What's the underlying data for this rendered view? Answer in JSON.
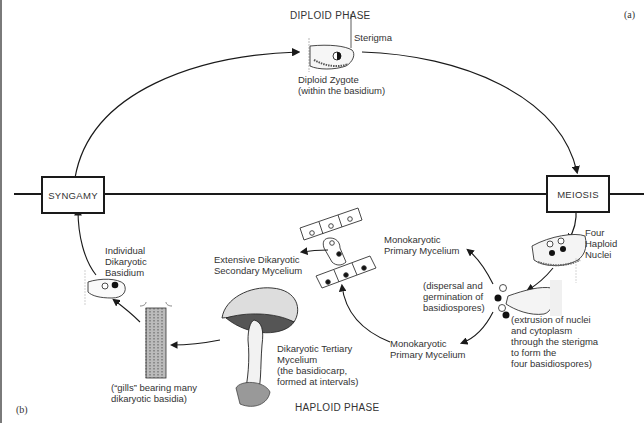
{
  "panels": {
    "top_right": "(a)",
    "bottom_left": "(b)"
  },
  "phases": {
    "diploid": "DIPLOID PHASE",
    "haploid": "HAPLOID PHASE"
  },
  "boxes": {
    "syngamy": "SYNGAMY",
    "meiosis": "MEIOSIS"
  },
  "labels": {
    "sterigma": "Sterigma",
    "diploid_zygote": "Diploid Zygote\n(within the basidium)",
    "four_haploid_nuclei": "Four\nHaploid\nNuclei",
    "extrusion": "(extrusion of nuclei\nand cytoplasm\nthrough the sterigma\nto form the\nfour basidiospores)",
    "dispersal": "(dispersal and\ngermination of\nbasidiospores)",
    "mono_primary_top": "Monokaryotic\nPrimary Mycelium",
    "mono_primary_bottom": "Monokaryotic\nPrimary Mycelium",
    "secondary_mycelium": "Extensive Dikaryotic\nSecondary Mycelium",
    "tertiary_mycelium": "Dikaryotic Tertiary\nMycelium\n(the basidiocarp,\nformed at intervals)",
    "gills": "(“gills” bearing many\ndikaryotic basidia)",
    "individual_basidium": "Individual\nDikaryotic\nBasidium"
  },
  "colors": {
    "ink": "#1a1a1a",
    "text": "#333333",
    "background": "#ffffff"
  }
}
